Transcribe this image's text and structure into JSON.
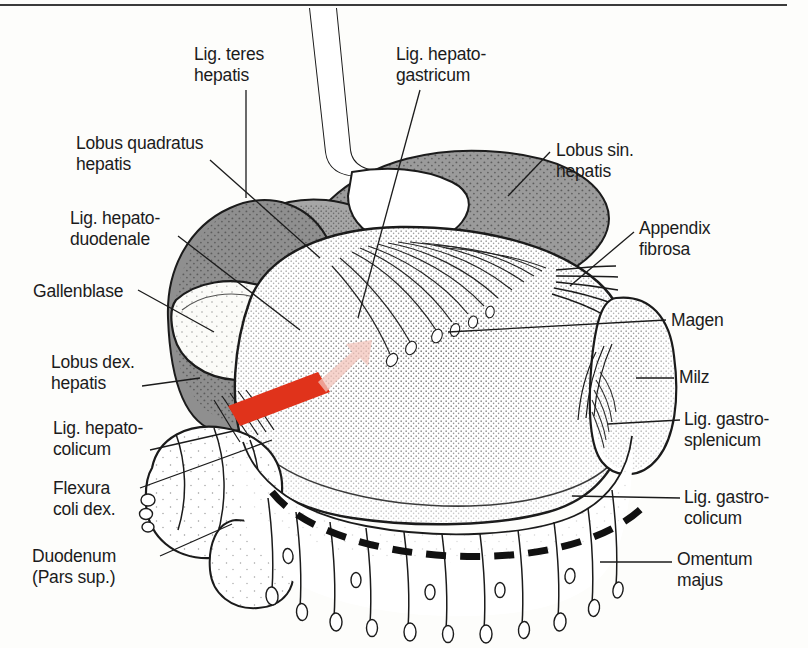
{
  "figure": {
    "type": "anatomical-illustration",
    "language": "de-la",
    "frame": {
      "top_rule": true,
      "rule_color": "#3b3b3b"
    },
    "colors": {
      "ink": "#1b1b1b",
      "paper": "#fdfdfb",
      "liver_dark": "#8f8f8f",
      "liver_mid": "#a8a8a8",
      "stipple": "#2b2b2b",
      "marker_red": "#e0331b",
      "marker_pink": "#f3c4bb"
    },
    "markers": [
      {
        "name": "red-bar-marker",
        "color": "#e0331b",
        "note": "slanted solid red bar over lobus dex. hepatis"
      },
      {
        "name": "pink-arrow-marker",
        "color": "#f3c4bb",
        "note": "pale pink arrow wedge pointing up-right"
      },
      {
        "name": "dashed-resection-line",
        "color": "#111111",
        "note": "heavy black dashed curve across omentum majus"
      }
    ]
  },
  "labels": [
    {
      "id": "lig-teres-hepatis",
      "lines": [
        "Lig. teres",
        "hepatis"
      ],
      "x": 194,
      "y": 44,
      "align": "left"
    },
    {
      "id": "lig-hepatogastricum",
      "lines": [
        "Lig. hepato-",
        "gastricum"
      ],
      "x": 396,
      "y": 44,
      "align": "left"
    },
    {
      "id": "lobus-quadratus",
      "lines": [
        "Lobus quadratus",
        "hepatis"
      ],
      "x": 76,
      "y": 133,
      "align": "left"
    },
    {
      "id": "lobus-sin-hepatis",
      "lines": [
        "Lobus sin.",
        "hepatis"
      ],
      "x": 556,
      "y": 140,
      "align": "left"
    },
    {
      "id": "lig-hepatoduodenale",
      "lines": [
        "Lig. hepato-",
        "duodenale"
      ],
      "x": 70,
      "y": 208,
      "align": "left"
    },
    {
      "id": "appendix-fibrosa",
      "lines": [
        "Appendix",
        "fibrosa"
      ],
      "x": 639,
      "y": 218,
      "align": "left"
    },
    {
      "id": "gallenblase",
      "lines": [
        "Gallenblase"
      ],
      "x": 33,
      "y": 281,
      "align": "left"
    },
    {
      "id": "magen",
      "lines": [
        "Magen"
      ],
      "x": 671,
      "y": 310,
      "align": "left"
    },
    {
      "id": "lobus-dex-hepatis",
      "lines": [
        "Lobus dex.",
        "hepatis"
      ],
      "x": 51,
      "y": 352,
      "align": "left"
    },
    {
      "id": "milz",
      "lines": [
        "Milz"
      ],
      "x": 679,
      "y": 367,
      "align": "left"
    },
    {
      "id": "lig-hepatocolicum",
      "lines": [
        "Lig. hepato-",
        "colicum"
      ],
      "x": 53,
      "y": 418,
      "align": "left"
    },
    {
      "id": "lig-gastrosplenicum",
      "lines": [
        "Lig. gastro-",
        "splenicum"
      ],
      "x": 684,
      "y": 409,
      "align": "left"
    },
    {
      "id": "flexura-coli-dex",
      "lines": [
        "Flexura",
        "coli dex."
      ],
      "x": 53,
      "y": 478,
      "align": "left"
    },
    {
      "id": "lig-gastrocolicum",
      "lines": [
        "Lig. gastro-",
        "colicum"
      ],
      "x": 684,
      "y": 487,
      "align": "left"
    },
    {
      "id": "duodenum",
      "lines": [
        "Duodenum",
        "(Pars sup.)"
      ],
      "x": 32,
      "y": 546,
      "align": "left"
    },
    {
      "id": "omentum-majus",
      "lines": [
        "Omentum",
        "majus"
      ],
      "x": 677,
      "y": 549,
      "align": "left"
    }
  ]
}
